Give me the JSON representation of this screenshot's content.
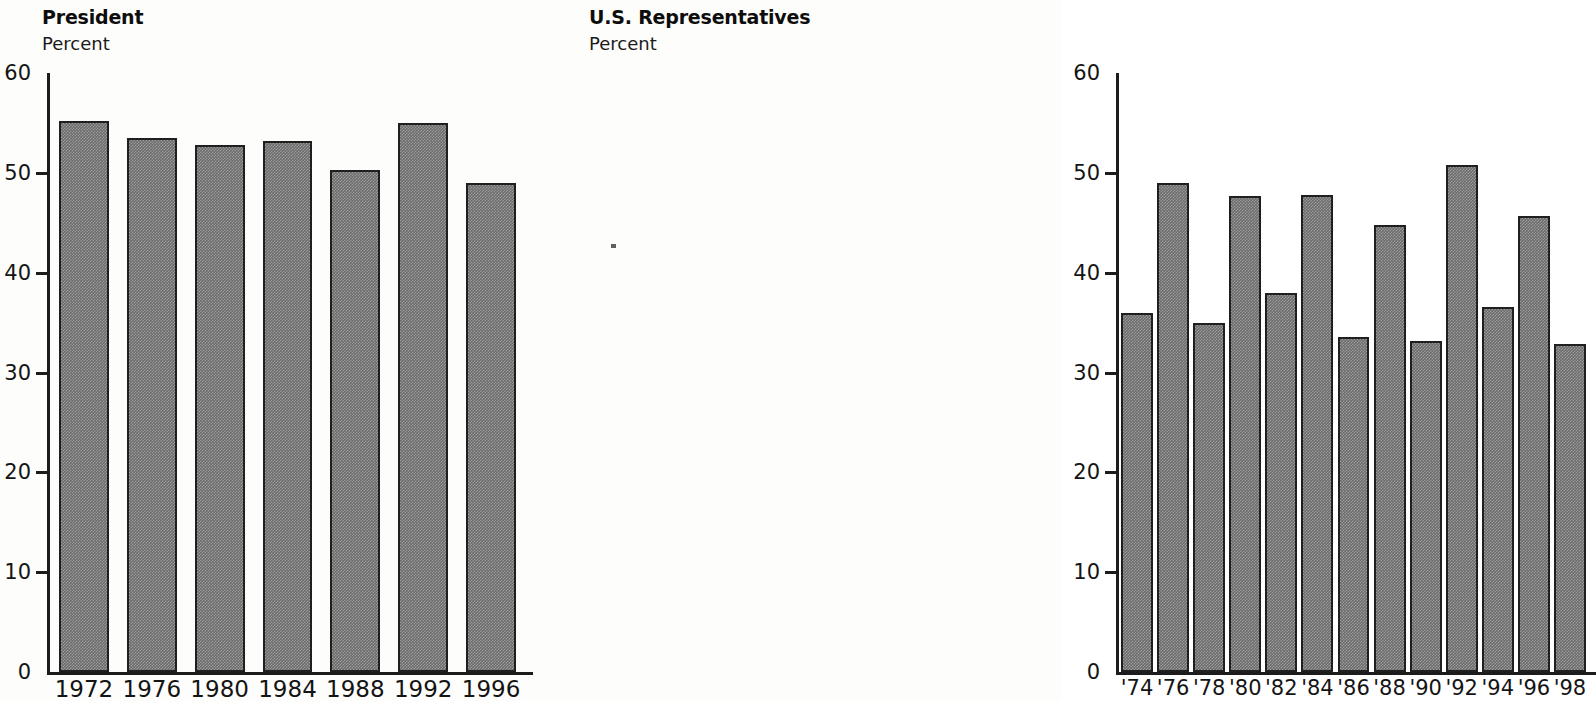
{
  "charts": [
    {
      "id": "president",
      "title": "President",
      "subtitle": "Percent",
      "y_ticks": [
        "0",
        "10",
        "20",
        "30",
        "40",
        "50",
        "60"
      ],
      "x_labels": [
        "1972",
        "1976",
        "1980",
        "1984",
        "1988",
        "1992",
        "1996"
      ]
    },
    {
      "id": "representatives",
      "title": "U.S. Representatives",
      "subtitle": "Percent",
      "y_ticks": [
        "0",
        "10",
        "20",
        "30",
        "40",
        "50",
        "60"
      ],
      "x_labels": [
        "'74",
        "'76",
        "'78",
        "'80",
        "'82",
        "'84",
        "'86",
        "'88",
        "'90",
        "'92",
        "'94",
        "'96",
        "'98"
      ]
    }
  ],
  "chart_data": [
    {
      "type": "bar",
      "title": "President",
      "subtitle": "Percent",
      "xlabel": "",
      "ylabel": "Percent",
      "ylim": [
        0,
        60
      ],
      "ytick_values": [
        0,
        10,
        20,
        30,
        40,
        50,
        60
      ],
      "grid": false,
      "legend": "none",
      "bar_color": "#6b6b6b",
      "bar_edge_color": "#1f1f1f",
      "categories": [
        "1972",
        "1976",
        "1980",
        "1984",
        "1988",
        "1992",
        "1996"
      ],
      "values": [
        55.2,
        53.5,
        52.8,
        53.2,
        50.3,
        55.0,
        49.0
      ]
    },
    {
      "type": "bar",
      "title": "U.S. Representatives",
      "subtitle": "Percent",
      "xlabel": "",
      "ylabel": "Percent",
      "ylim": [
        0,
        60
      ],
      "ytick_values": [
        0,
        10,
        20,
        30,
        40,
        50,
        60
      ],
      "grid": false,
      "legend": "none",
      "bar_color": "#6b6b6b",
      "bar_edge_color": "#1f1f1f",
      "categories": [
        "'74",
        "'76",
        "'78",
        "'80",
        "'82",
        "'84",
        "'86",
        "'88",
        "'90",
        "'92",
        "'94",
        "'96",
        "'98"
      ],
      "values": [
        36.0,
        49.0,
        35.0,
        47.7,
        38.0,
        47.8,
        33.6,
        44.8,
        33.2,
        50.8,
        36.6,
        45.7,
        32.9
      ]
    }
  ]
}
